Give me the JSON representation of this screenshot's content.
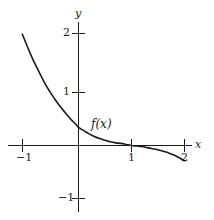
{
  "figure": {
    "background_color": "#ffffff",
    "stroke_color": "#1a1a1a"
  },
  "chart_data": {
    "type": "line",
    "title": "",
    "subtitle": "",
    "xlabel": "x",
    "ylabel": "y",
    "xlim": [
      -1.32,
      2.26
    ],
    "ylim": [
      -1.36,
      2.27
    ],
    "grid": false,
    "legend": null,
    "axes_style": "centered-cross",
    "xticks": [
      -1,
      1,
      2
    ],
    "xtick_labels": [
      "−1",
      "1",
      "2"
    ],
    "yticks": [
      2,
      1,
      -1
    ],
    "ytick_labels": [
      "2",
      "1",
      "−1"
    ],
    "annotations": [
      {
        "text": "f(x)",
        "x": 0.25,
        "y": 0.46
      }
    ],
    "series": [
      {
        "name": "f(x)",
        "description": "exponentially decaying curve that falls from y=2 at x=-1, crosses the y-axis near y=0.32, flattens along the x-axis past x=1, then dips slightly below the axis toward x=2",
        "x": [
          -1.06,
          -0.95,
          -0.85,
          -0.75,
          -0.65,
          -0.55,
          -0.45,
          -0.35,
          -0.25,
          -0.15,
          -0.05,
          0.0,
          0.1,
          0.2,
          0.3,
          0.4,
          0.5,
          0.6,
          0.7,
          0.8,
          0.9,
          1.0,
          1.1,
          1.2,
          1.3,
          1.4,
          1.5,
          1.6,
          1.7,
          1.8,
          1.9,
          2.0
        ],
        "y": [
          2.1,
          1.83,
          1.6,
          1.4,
          1.2,
          1.03,
          0.88,
          0.74,
          0.62,
          0.5,
          0.4,
          0.34,
          0.28,
          0.22,
          0.17,
          0.13,
          0.1,
          0.07,
          0.05,
          0.04,
          0.02,
          0.0,
          -0.01,
          -0.02,
          -0.04,
          -0.06,
          -0.08,
          -0.11,
          -0.14,
          -0.18,
          -0.23,
          -0.29
        ]
      }
    ]
  },
  "labels": {
    "y_axis": "y",
    "x_axis": "x",
    "y_2": "2",
    "y_1": "1",
    "y_minus1": "−1",
    "x_minus1": "−1",
    "x_1": "1",
    "x_2": "2",
    "function": "f(x)"
  }
}
